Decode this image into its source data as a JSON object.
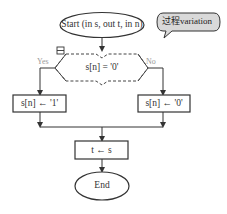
{
  "flowchart": {
    "start": {
      "label": "Start (in s, out t, in n)"
    },
    "callout": {
      "label": "过程variation",
      "fill": "#d9d9d9"
    },
    "decision": {
      "condition": "s[n] = '0'",
      "yes_label": "Yes",
      "no_label": "No",
      "collapse_icon": "collapse-icon"
    },
    "yes_action": {
      "label": "s[n] ← '1'"
    },
    "no_action": {
      "label": "s[n] ← '0'"
    },
    "assign": {
      "label": "t ← s"
    },
    "end": {
      "label": "End"
    }
  },
  "colors": {
    "stroke": "#333333",
    "faint_label": "#9a9a9a",
    "dashed": "#444444"
  }
}
